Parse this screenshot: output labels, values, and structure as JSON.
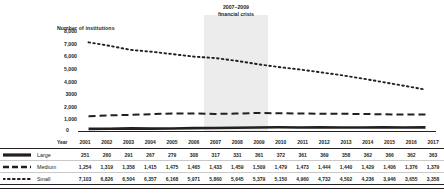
{
  "chart_data": {
    "type": "line",
    "title": "Number of institutions",
    "xlabel": "Year",
    "ylabel": "Number of institutions",
    "ylim": [
      0,
      8000
    ],
    "grid": false,
    "legend_position": "bottom-table",
    "yticks": [
      "8,000",
      "7,000",
      "6,000",
      "5,000",
      "4,000",
      "3000",
      "2,000",
      "1,000",
      "0"
    ],
    "ytick_values": [
      8000,
      7000,
      6000,
      5000,
      4000,
      3000,
      2000,
      1000,
      0
    ],
    "categories": [
      "2001",
      "2002",
      "2003",
      "2004",
      "2005",
      "2006",
      "2007",
      "2008",
      "2009",
      "2010",
      "2011",
      "2012",
      "2013",
      "2014",
      "2015",
      "2016",
      "2017"
    ],
    "series": [
      {
        "name": "Large",
        "style": "solid",
        "values": [
          251,
          260,
          291,
          267,
          279,
          308,
          317,
          331,
          361,
          372,
          361,
          369,
          358,
          362,
          366,
          362,
          363
        ]
      },
      {
        "name": "Medium",
        "style": "dashed",
        "values": [
          1254,
          1319,
          1358,
          1415,
          1475,
          1465,
          1433,
          1459,
          1509,
          1479,
          1473,
          1444,
          1440,
          1429,
          1406,
          1376,
          1379
        ]
      },
      {
        "name": "Small",
        "style": "dotted",
        "values": [
          7103,
          6826,
          6504,
          6357,
          6168,
          5971,
          5860,
          5645,
          5379,
          5150,
          4960,
          4732,
          4502,
          4236,
          3946,
          3655,
          3358
        ]
      }
    ],
    "annotations": [
      {
        "name": "recession-band",
        "line1": "2007–2009",
        "line2": "financial crisis",
        "start": "2007",
        "end": "2009"
      }
    ]
  },
  "table": {
    "year_header": "Year",
    "columns": [
      "2001",
      "2002",
      "2003",
      "2004",
      "2005",
      "2006",
      "2007",
      "2008",
      "2009",
      "2010",
      "2011",
      "2012",
      "2013",
      "2014",
      "2015",
      "2016",
      "2017"
    ],
    "rows": [
      {
        "label": "Large",
        "marker": "solid-line-marker",
        "cells": [
          "251",
          "260",
          "291",
          "267",
          "279",
          "308",
          "317",
          "331",
          "361",
          "372",
          "361",
          "369",
          "358",
          "362",
          "366",
          "362",
          "363"
        ]
      },
      {
        "label": "Medium",
        "marker": "dashed-line-marker",
        "cells": [
          "1,254",
          "1,319",
          "1,358",
          "1,415",
          "1,475",
          "1,465",
          "1,433",
          "1,459",
          "1,509",
          "1,479",
          "1,473",
          "1,444",
          "1,440",
          "1,429",
          "1,406",
          "1,376",
          "1,379"
        ]
      },
      {
        "label": "Small",
        "marker": "dotted-line-marker",
        "cells": [
          "7,103",
          "6,826",
          "6,504",
          "6,357",
          "6,168",
          "5,971",
          "5,860",
          "5,645",
          "5,379",
          "5,150",
          "4,960",
          "4,732",
          "4,502",
          "4,236",
          "3,946",
          "3,655",
          "3,358"
        ]
      }
    ]
  },
  "colors": {
    "ink": "#231f20",
    "band": "#ececec",
    "rule": "#c9c9c9"
  }
}
